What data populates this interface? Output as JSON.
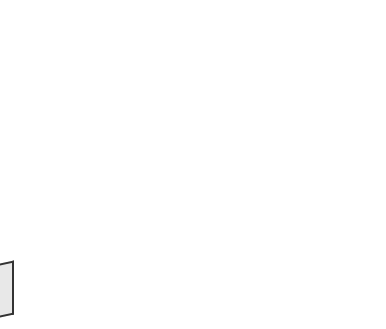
{
  "figure": {
    "background": "#ffffff",
    "colors": {
      "front_light": "#f2f2f2",
      "front_mid": "#b8b8b8",
      "front_dark": "#6e6e6e",
      "side_light": "#9a9a9a",
      "side_dark": "#3a3a3a",
      "sign": "#2a2a2a"
    },
    "labels": {
      "plus": "+",
      "minus": "−"
    },
    "front_face": [
      {
        "x": 30,
        "y": 55,
        "r": 25,
        "ion": "minus"
      },
      {
        "x": 52,
        "y": 68,
        "r": 17,
        "ion": "plus"
      },
      {
        "x": 80,
        "y": 72,
        "r": 25,
        "ion": "minus"
      },
      {
        "x": 103,
        "y": 83,
        "r": 17,
        "ion": "plus"
      },
      {
        "x": 130,
        "y": 88,
        "r": 25,
        "ion": "minus"
      },
      {
        "x": 160,
        "y": 100,
        "r": 17,
        "ion": "plus"
      },
      {
        "x": 188,
        "y": 110,
        "r": 25,
        "ion": "minus"
      },
      {
        "x": 30,
        "y": 110,
        "r": 17,
        "ion": "plus"
      },
      {
        "x": 55,
        "y": 112,
        "r": 25,
        "ion": "minus"
      },
      {
        "x": 80,
        "y": 120,
        "r": 17,
        "ion": "plus"
      },
      {
        "x": 105,
        "y": 128,
        "r": 25,
        "ion": "minus"
      },
      {
        "x": 132,
        "y": 138,
        "r": 17,
        "ion": "plus"
      },
      {
        "x": 155,
        "y": 148,
        "r": 25,
        "ion": "minus"
      },
      {
        "x": 185,
        "y": 158,
        "r": 17,
        "ion": "plus"
      },
      {
        "x": 30,
        "y": 148,
        "r": 25,
        "ion": "minus"
      },
      {
        "x": 55,
        "y": 158,
        "r": 17,
        "ion": "plus"
      },
      {
        "x": 80,
        "y": 165,
        "r": 25,
        "ion": "minus"
      },
      {
        "x": 105,
        "y": 175,
        "r": 17,
        "ion": "plus"
      },
      {
        "x": 130,
        "y": 180,
        "r": 25,
        "ion": "minus"
      },
      {
        "x": 158,
        "y": 190,
        "r": 17,
        "ion": "plus"
      },
      {
        "x": 180,
        "y": 198,
        "r": 25,
        "ion": "minus"
      },
      {
        "x": 32,
        "y": 192,
        "r": 17,
        "ion": "plus"
      },
      {
        "x": 50,
        "y": 198,
        "r": 25,
        "ion": "minus"
      },
      {
        "x": 80,
        "y": 208,
        "r": 17,
        "ion": "plus"
      },
      {
        "x": 103,
        "y": 215,
        "r": 25,
        "ion": "minus"
      },
      {
        "x": 135,
        "y": 225,
        "r": 17,
        "ion": "plus"
      },
      {
        "x": 155,
        "y": 232,
        "r": 25,
        "ion": "minus"
      },
      {
        "x": 185,
        "y": 243,
        "r": 17,
        "ion": "plus"
      },
      {
        "x": 32,
        "y": 228,
        "r": 25,
        "ion": "minus"
      },
      {
        "x": 55,
        "y": 242,
        "r": 17,
        "ion": "plus"
      },
      {
        "x": 78,
        "y": 248,
        "r": 25,
        "ion": "minus"
      },
      {
        "x": 110,
        "y": 260,
        "r": 17,
        "ion": "plus"
      },
      {
        "x": 130,
        "y": 267,
        "r": 25,
        "ion": "minus"
      },
      {
        "x": 160,
        "y": 282,
        "r": 17,
        "ion": "plus"
      },
      {
        "x": 183,
        "y": 288,
        "r": 25,
        "ion": "minus"
      }
    ],
    "side_face_minus_marks": [
      {
        "x": 337,
        "y": 48
      },
      {
        "x": 300,
        "y": 68
      },
      {
        "x": 245,
        "y": 85
      },
      {
        "x": 322,
        "y": 108
      },
      {
        "x": 265,
        "y": 127
      },
      {
        "x": 215,
        "y": 143
      },
      {
        "x": 345,
        "y": 145
      },
      {
        "x": 295,
        "y": 162
      },
      {
        "x": 240,
        "y": 180
      },
      {
        "x": 345,
        "y": 195
      },
      {
        "x": 265,
        "y": 215
      },
      {
        "x": 300,
        "y": 245
      },
      {
        "x": 350,
        "y": 227
      },
      {
        "x": 245,
        "y": 263
      }
    ]
  }
}
